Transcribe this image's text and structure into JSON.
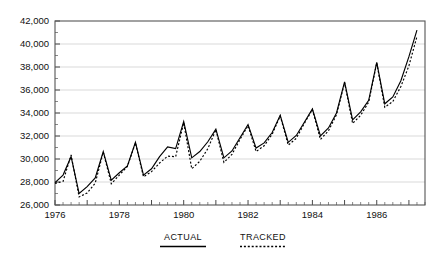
{
  "chart_data": {
    "type": "line",
    "title": "",
    "xlabel": "",
    "ylabel": "",
    "grid": true,
    "ylim": [
      26000,
      42000
    ],
    "ytick_step": 2000,
    "yminor_step": 1000,
    "xlim": [
      1976.0,
      1987.5
    ],
    "legend_position": "below-axis",
    "ytick_labels": [
      "26,000",
      "28,000",
      "30,000",
      "32,000",
      "34,000",
      "36,000",
      "38,000",
      "40,000",
      "42,000"
    ],
    "ytick_values": [
      26000,
      28000,
      30000,
      32000,
      34000,
      36000,
      38000,
      40000,
      42000
    ],
    "xtick_labels": [
      "1976",
      "1978",
      "1980",
      "1982",
      "1984",
      "1986"
    ],
    "xtick_values": [
      1976,
      1978,
      1980,
      1982,
      1984,
      1986
    ],
    "x_minor_interval": "quarterly",
    "x": [
      1976.0,
      1976.25,
      1976.5,
      1976.75,
      1977.0,
      1977.25,
      1977.5,
      1977.75,
      1978.0,
      1978.25,
      1978.5,
      1978.75,
      1979.0,
      1979.25,
      1979.5,
      1979.75,
      1980.0,
      1980.25,
      1980.5,
      1980.75,
      1981.0,
      1981.25,
      1981.5,
      1981.75,
      1982.0,
      1982.25,
      1982.5,
      1982.75,
      1983.0,
      1983.25,
      1983.5,
      1983.75,
      1984.0,
      1984.25,
      1984.5,
      1984.75,
      1985.0,
      1985.25,
      1985.5,
      1985.75,
      1986.0,
      1986.25,
      1986.5,
      1986.75,
      1987.0,
      1987.25
    ],
    "series": [
      {
        "name": "ACTUAL",
        "style": "solid",
        "color": "#000000",
        "values": [
          27950,
          28600,
          30200,
          27000,
          27600,
          28350,
          30650,
          28150,
          28800,
          29400,
          31450,
          28600,
          29150,
          30200,
          31050,
          30900,
          33250,
          30100,
          30650,
          31500,
          32600,
          30100,
          30700,
          31850,
          33000,
          30950,
          31400,
          32300,
          33800,
          31450,
          32050,
          33200,
          34350,
          32000,
          32700,
          34000,
          36700,
          33400,
          34100,
          35100,
          38400,
          34800,
          35400,
          36800,
          38900,
          41200
        ]
      },
      {
        "name": "TRACKED",
        "style": "dotted",
        "color": "#000000",
        "values": [
          27880,
          28050,
          30350,
          26700,
          27050,
          27900,
          30600,
          27850,
          28600,
          29350,
          31400,
          28450,
          28900,
          29650,
          30250,
          30200,
          33150,
          29150,
          29800,
          30900,
          32550,
          29700,
          30400,
          31700,
          32900,
          30650,
          31150,
          32150,
          33750,
          31200,
          31800,
          33100,
          34300,
          31700,
          32450,
          33850,
          36650,
          33100,
          33800,
          34950,
          38350,
          34500,
          35000,
          36300,
          38100,
          40650
        ]
      }
    ]
  },
  "legend": {
    "actual_label": "ACTUAL",
    "tracked_label": "TRACKED"
  }
}
